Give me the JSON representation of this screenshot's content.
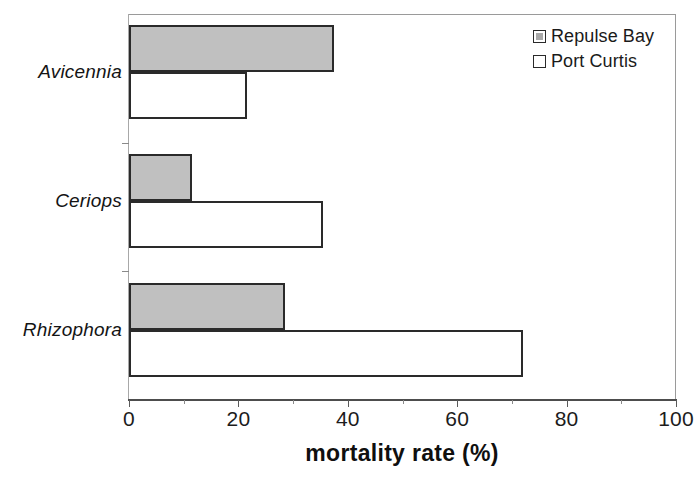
{
  "chart_data": {
    "type": "bar",
    "orientation": "horizontal",
    "title": "",
    "xlabel": "mortality rate (%)",
    "ylabel": "",
    "xlim": [
      0,
      100
    ],
    "xticks": [
      0,
      20,
      40,
      60,
      80,
      100
    ],
    "xtick_labels": [
      "0",
      "20",
      "40",
      "60",
      "80",
      "100"
    ],
    "minor_tick_step": 10,
    "grid": false,
    "categories": [
      "Avicennia",
      "Ceriops",
      "Rhizophora"
    ],
    "series": [
      {
        "name": "Repulse Bay",
        "values": [
          37.5,
          11.5,
          28.5
        ],
        "fill": "#c0c0c0",
        "style": "filled"
      },
      {
        "name": "Port Curtis",
        "values": [
          21.5,
          35.5,
          72.0
        ],
        "fill": "#ffffff",
        "style": "hollow"
      }
    ],
    "legend": {
      "position": "top-right",
      "entries": [
        {
          "label": "Repulse Bay",
          "swatch": "filled"
        },
        {
          "label": "Port Curtis",
          "swatch": "hollow"
        }
      ]
    },
    "colors": {
      "bar_border": "#2a2a2a",
      "repulse_bay_fill": "#c0c0c0",
      "port_curtis_fill": "#ffffff",
      "axis": "#4d4d4d",
      "text": "#1a1a1a",
      "background": "#ffffff"
    }
  }
}
